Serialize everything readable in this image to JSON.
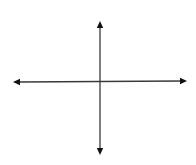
{
  "diagram": {
    "type": "coordinate-axes",
    "colors": {
      "background": "#ffffff",
      "stroke": "#3a3a3a",
      "arrowhead": "#111111"
    },
    "horizontal_axis": {
      "x1": 13,
      "y1": 82,
      "x2": 187,
      "y2": 81,
      "arrows": "both"
    },
    "vertical_axis": {
      "x1": 100,
      "y1": 21,
      "x2": 100,
      "y2": 155,
      "arrows": "both"
    },
    "origin": {
      "x": 100,
      "y": 81
    },
    "labels": []
  }
}
